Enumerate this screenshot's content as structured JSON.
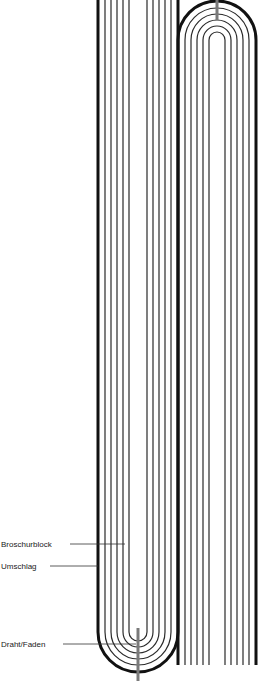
{
  "diagram": {
    "type": "binding-cross-section",
    "labels": [
      {
        "id": "broschurblock",
        "text": "Broschurblock",
        "x": 1,
        "y": 547,
        "leader_x1": 70,
        "leader_x2": 125,
        "leader_y": 544
      },
      {
        "id": "umschlag",
        "text": "Umschlag",
        "x": 1,
        "y": 569,
        "leader_x1": 50,
        "leader_x2": 98,
        "leader_y": 566
      },
      {
        "id": "draht-faden",
        "text": "Draht/Faden",
        "x": 1,
        "y": 647,
        "leader_x1": 63,
        "leader_x2": 136,
        "leader_y": 644
      }
    ],
    "colors": {
      "cover": "#111111",
      "pages": "#2a2a2a",
      "wire": "#7a7a7a",
      "leader": "#333333"
    },
    "signatures": [
      {
        "id": "left-signature",
        "center_x": 138,
        "arc_center_y": 632,
        "orientation": "fold-bottom",
        "straight_end_y": 0,
        "outer_radius": 40,
        "page_radii": [
          33,
          27,
          21,
          15,
          9
        ],
        "wire_y1": 628,
        "wire_y2": 681
      },
      {
        "id": "right-signature",
        "center_x": 217,
        "arc_center_y": 40,
        "orientation": "fold-top",
        "straight_end_y": 665,
        "outer_radius": 39,
        "page_radii": [
          32,
          26,
          20,
          14,
          8
        ],
        "wire_y1": 0,
        "wire_y2": 20
      }
    ]
  }
}
